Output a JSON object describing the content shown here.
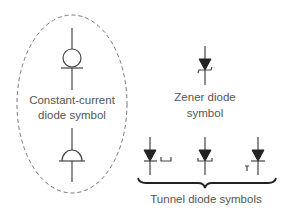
{
  "diagram": {
    "title": "Diode symbols",
    "groups": [
      {
        "id": "constant-current",
        "label_lines": [
          "Constant-current",
          "diode symbol"
        ],
        "symbol_count": 2,
        "enclosure": "dashed-ellipse"
      },
      {
        "id": "zener",
        "label_lines": [
          "Zener diode",
          "symbol"
        ],
        "symbol_count": 1
      },
      {
        "id": "tunnel",
        "label_lines": [
          "Tunnel diode symbols"
        ],
        "symbol_count": 3,
        "grouping": "curly-brace"
      }
    ]
  },
  "colors": {
    "line": "#444444",
    "symbol_fill": "#222222",
    "text": "#555555",
    "dashed_ellipse": "#777777",
    "background": "#ffffff"
  }
}
